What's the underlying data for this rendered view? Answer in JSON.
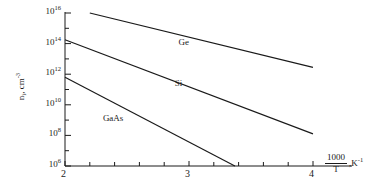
{
  "chart_data": {
    "type": "line",
    "title": "",
    "xlabel": "1000/T , K⁻¹",
    "xlabel_parts": {
      "numerator": "1000",
      "denominator": "T",
      "separator": ",",
      "unit": "K",
      "unit_exp": "-1"
    },
    "ylabel": "n_i, cm^-3",
    "ylabel_parts": {
      "base": "n",
      "sub": "i",
      "rest": ", cm",
      "sup": "-3"
    },
    "xlim": [
      2,
      4
    ],
    "ylim_log10": [
      6,
      16
    ],
    "xticks": [
      2,
      3,
      4
    ],
    "xtick_labels": [
      "2",
      "3",
      "4"
    ],
    "xminor_ticks": [
      2.2,
      2.4,
      2.6,
      2.8,
      3.2,
      3.4,
      3.6,
      3.8
    ],
    "yticks_log10": [
      6,
      8,
      10,
      12,
      14,
      16
    ],
    "ytick_labels": [
      "10⁶",
      "10⁸",
      "10¹⁰",
      "10¹²",
      "10¹⁴",
      "10¹⁶"
    ],
    "ytick_mantissa": "10",
    "ytick_exponents": [
      "6",
      "8",
      "10",
      "12",
      "14",
      "16"
    ],
    "yminor_ticks_log10": [
      7,
      9,
      11,
      13,
      15
    ],
    "grid": false,
    "legend": "inline-labels",
    "line_color": "#1a1a1a",
    "series": [
      {
        "name": "Ge",
        "label": "Ge",
        "points_x": [
          2.2,
          4.0
        ],
        "points_log10y": [
          16.0,
          12.45
        ],
        "label_x": 2.98,
        "label_log10y": 14.05
      },
      {
        "name": "Si",
        "label": "Si",
        "points_x": [
          2.0,
          4.0
        ],
        "points_log10y": [
          14.25,
          8.1
        ],
        "label_x": 2.95,
        "label_log10y": 11.35
      },
      {
        "name": "GaAs",
        "label": "GaAs",
        "points_x": [
          2.0,
          3.37
        ],
        "points_log10y": [
          11.8,
          6.0
        ],
        "label_x": 2.37,
        "label_log10y": 9.1
      }
    ]
  },
  "axes": {
    "x_axis_name": "inverse-temperature-axis",
    "y_axis_name": "intrinsic-carrier-concentration-axis"
  }
}
